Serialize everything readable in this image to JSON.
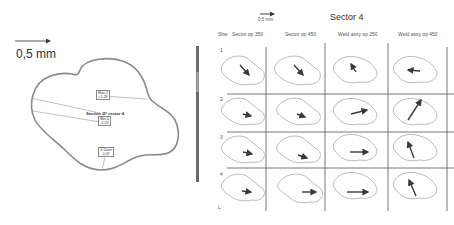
{
  "left_panel": {
    "scale_bar_label": "0,5 mm",
    "section_title": "Section Ø! sector 4",
    "annotations": [
      {
        "name": "Max 4",
        "value": "+1.28"
      },
      {
        "name": "Min 4",
        "value": "-1.23"
      },
      {
        "name": "X Dose",
        "value": "0.02"
      }
    ]
  },
  "colorbar": {
    "ticks": [
      "",
      "",
      "",
      "",
      "",
      "",
      "",
      "",
      "",
      "",
      ""
    ]
  },
  "right_panel": {
    "scale_bar_label": "0,5 mm",
    "title": "Sector 4",
    "row_header": "Shw",
    "columns": [
      "Sector op 350",
      "Sector op 450",
      "Weld assy op 250",
      "Weld assy op 450"
    ],
    "rows": [
      "1",
      "2",
      "3",
      "4"
    ],
    "footer_mark": "L"
  },
  "colors": {
    "outline": "#8a8a8a",
    "arrow": "#3a3a3a",
    "grid_line": "#555555",
    "text": "#333333"
  }
}
